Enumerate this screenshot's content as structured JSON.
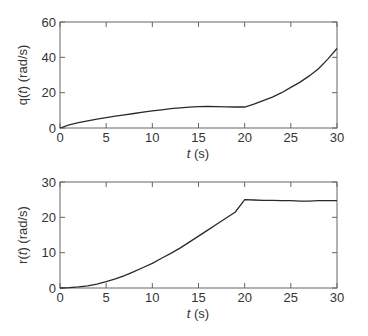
{
  "chart_data": [
    {
      "type": "line",
      "title": "",
      "xlabel": "t (s)",
      "ylabel": "q(t) (rad/s)",
      "xlim": [
        0,
        30
      ],
      "ylim": [
        0,
        60
      ],
      "xticks": [
        0,
        5,
        10,
        15,
        20,
        25,
        30
      ],
      "yticks": [
        0,
        20,
        40,
        60
      ],
      "grid": false,
      "series": [
        {
          "name": "q(t)",
          "x": [
            0,
            1,
            2,
            3,
            4,
            5,
            6,
            7,
            8,
            9,
            10,
            11,
            12,
            13,
            14,
            15,
            16,
            17,
            18,
            19,
            20,
            21,
            22,
            23,
            24,
            25,
            26,
            27,
            28,
            29,
            30
          ],
          "values": [
            0,
            1.8,
            3.0,
            4.0,
            5.0,
            5.9,
            6.7,
            7.5,
            8.2,
            9.0,
            9.7,
            10.3,
            10.9,
            11.4,
            11.8,
            12.1,
            12.2,
            12.1,
            12.0,
            11.9,
            11.9,
            13.5,
            15.5,
            17.5,
            20.0,
            23.0,
            26.0,
            29.5,
            33.5,
            39.0,
            45.0
          ]
        }
      ]
    },
    {
      "type": "line",
      "title": "",
      "xlabel": "t (s)",
      "ylabel": "r(t) (rad/s)",
      "xlim": [
        0,
        30
      ],
      "ylim": [
        0,
        30
      ],
      "xticks": [
        0,
        5,
        10,
        15,
        20,
        25,
        30
      ],
      "yticks": [
        0,
        10,
        20,
        30
      ],
      "grid": false,
      "series": [
        {
          "name": "r(t)",
          "x": [
            0,
            1,
            2,
            3,
            4,
            5,
            6,
            7,
            8,
            9,
            10,
            11,
            12,
            13,
            14,
            15,
            16,
            17,
            18,
            19,
            20,
            21,
            22,
            23,
            24,
            25,
            26,
            27,
            28,
            29,
            30
          ],
          "values": [
            0,
            0.1,
            0.3,
            0.6,
            1.1,
            1.8,
            2.6,
            3.5,
            4.6,
            5.8,
            7.0,
            8.4,
            9.8,
            11.3,
            13.0,
            14.7,
            16.4,
            18.1,
            19.8,
            21.5,
            25.0,
            24.9,
            24.8,
            24.8,
            24.7,
            24.7,
            24.6,
            24.6,
            24.7,
            24.7,
            24.7
          ]
        }
      ]
    }
  ],
  "plots": [
    {
      "ylabel_prefix": "q(",
      "ylabel_t": "t",
      "ylabel_suffix": ") (rad/s)",
      "xlabel_t": "t",
      "xlabel_unit": " (s)"
    },
    {
      "ylabel_prefix": "r(",
      "ylabel_t": "t",
      "ylabel_suffix": ") (rad/s)",
      "xlabel_t": "t",
      "xlabel_unit": " (s)"
    }
  ],
  "colors": {
    "axis": "#666666",
    "line": "#2a2a2a",
    "text": "#333333"
  }
}
